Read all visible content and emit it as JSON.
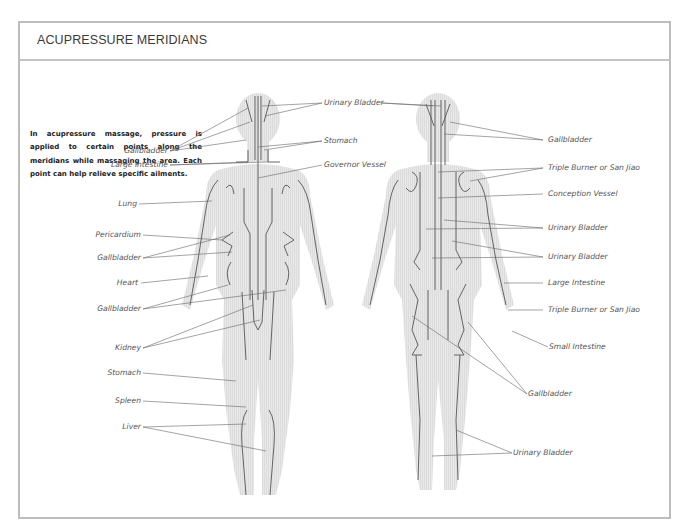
{
  "header": {
    "title": "ACUPRESSURE MERIDIANS"
  },
  "intro": {
    "text": "In acupressure massage, pressure is applied to certain points along the meridians while massaging the area. Each point can help relieve specific ailments."
  },
  "colors": {
    "border": "#bdbdbd",
    "meridian_line": "#555555",
    "leader_line": "#666666",
    "body_fill": "#e6e6e6",
    "label_text": "#555555"
  },
  "front_figure": {
    "left_labels": [
      {
        "text": "Gallbladder"
      },
      {
        "text": "Large intestine"
      },
      {
        "text": "Lung"
      },
      {
        "text": "Pericardium"
      },
      {
        "text": "Gallbladder"
      },
      {
        "text": "Heart"
      },
      {
        "text": "Gallbladder"
      },
      {
        "text": "Kidney"
      },
      {
        "text": "Stomach"
      },
      {
        "text": "Spleen"
      },
      {
        "text": "Liver"
      }
    ],
    "center_labels": [
      {
        "text": "Urinary Bladder"
      },
      {
        "text": "Stomach"
      },
      {
        "text": "Governor Vessel"
      }
    ]
  },
  "back_figure": {
    "right_labels": [
      {
        "text": "Gallbladder"
      },
      {
        "text": "Triple Burner or San Jiao"
      },
      {
        "text": "Conception Vessel"
      },
      {
        "text": "Urinary Bladder"
      },
      {
        "text": "Urinary Bladder"
      },
      {
        "text": "Large Intestine"
      },
      {
        "text": "Triple Burner or San Jiao"
      },
      {
        "text": "Small Intestine"
      },
      {
        "text": "Gallbladder"
      },
      {
        "text": "Urinary Bladder"
      }
    ]
  }
}
